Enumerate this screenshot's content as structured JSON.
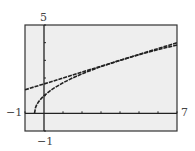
{
  "chart_data": {
    "type": "line",
    "title": "",
    "xlabel": "",
    "ylabel": "",
    "xlim": [
      -1,
      7
    ],
    "ylim": [
      -1,
      5
    ],
    "grid": false,
    "legend": null,
    "tick_labels": {
      "xmin": "−1",
      "xmax": "7",
      "ymin": "−1",
      "ymax": "5"
    },
    "x_tick_step": 1,
    "y_tick_step": 1,
    "series": [
      {
        "name": "curve y = sqrt(2x + 1)",
        "x": [
          -0.5,
          -0.45,
          -0.4,
          -0.3,
          -0.2,
          -0.1,
          0,
          0.25,
          0.5,
          1,
          1.5,
          2,
          3,
          4,
          5,
          6,
          7
        ],
        "y": [
          0,
          0.32,
          0.45,
          0.63,
          0.77,
          0.89,
          1,
          1.22,
          1.41,
          1.73,
          2,
          2.24,
          2.65,
          3,
          3.32,
          3.61,
          3.87
        ]
      },
      {
        "name": "tangent line y = x/3 + 5/3",
        "x": [
          -1,
          7
        ],
        "y": [
          1.33,
          4.0
        ]
      }
    ],
    "colors": {
      "plot_background": "#eeeeee",
      "frame": "#333333",
      "axes": "#222222",
      "curves": "#222222"
    }
  }
}
